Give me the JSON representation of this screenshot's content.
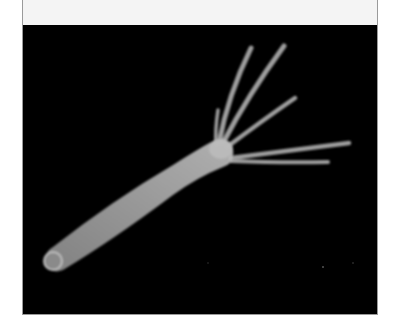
{
  "figure": {
    "colors": {
      "background": "#000000",
      "organism": "#bdbdbd",
      "top_band": "#f4f4f4",
      "border": "#9a9a9a"
    },
    "tentacle_count": 5
  }
}
